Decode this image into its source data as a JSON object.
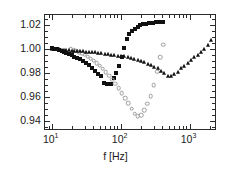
{
  "chart_data": {
    "type": "scatter",
    "title": "",
    "xlabel": "f [Hz]",
    "ylabel": "",
    "xscale": "log",
    "yscale": "linear",
    "xlim": [
      8,
      2500
    ],
    "ylim": [
      0.932,
      1.028
    ],
    "grid": false,
    "legend": "none",
    "xticks": [
      {
        "value": 10,
        "label": "10",
        "exp": "1"
      },
      {
        "value": 100,
        "label": "10",
        "exp": "2"
      },
      {
        "value": 1000,
        "label": "10",
        "exp": "3"
      }
    ],
    "yticks": [
      {
        "value": 1.02,
        "label": "1.02"
      },
      {
        "value": 1.0,
        "label": "1.00"
      },
      {
        "value": 0.98,
        "label": "0.98"
      },
      {
        "value": 0.96,
        "label": "0.96"
      },
      {
        "value": 0.94,
        "label": "0.94"
      }
    ],
    "series": [
      {
        "name": "filled-squares",
        "marker": "square",
        "filled": true,
        "color": "#111111",
        "points": [
          [
            10.0,
            1.0005
          ],
          [
            10.9,
            1.0002
          ],
          [
            11.8,
            0.9998
          ],
          [
            12.8,
            0.9992
          ],
          [
            13.9,
            0.9985
          ],
          [
            15.1,
            0.9977
          ],
          [
            16.4,
            0.9968
          ],
          [
            17.9,
            0.9958
          ],
          [
            19.5,
            0.9947
          ],
          [
            21.3,
            0.9936
          ],
          [
            23.4,
            0.9925
          ],
          [
            25.7,
            0.9912
          ],
          [
            28.3,
            0.9898
          ],
          [
            31.2,
            0.9882
          ],
          [
            34.5,
            0.9864
          ],
          [
            38.2,
            0.9843
          ],
          [
            42.4,
            0.982
          ],
          [
            47.2,
            0.9795
          ],
          [
            52.5,
            0.9774
          ],
          [
            58.0,
            0.9715
          ],
          [
            63.0,
            0.971
          ],
          [
            68.0,
            0.971
          ],
          [
            73.0,
            0.9712
          ],
          [
            79.0,
            0.9755
          ],
          [
            86.0,
            0.98
          ],
          [
            94.0,
            0.986
          ],
          [
            103.0,
            0.993
          ],
          [
            112.0,
            1.0005
          ],
          [
            122.0,
            1.0078
          ],
          [
            133.0,
            1.0122
          ],
          [
            146.0,
            1.0145
          ],
          [
            160.0,
            1.0168
          ],
          [
            176.0,
            1.0182
          ],
          [
            194.0,
            1.0195
          ],
          [
            214.0,
            1.0202
          ],
          [
            236.0,
            1.0208
          ],
          [
            262.0,
            1.0212
          ],
          [
            292.0,
            1.0216
          ],
          [
            326.0,
            1.0218
          ],
          [
            366.0,
            1.022
          ],
          [
            412.0,
            1.0222
          ]
        ]
      },
      {
        "name": "open-circles",
        "marker": "circle",
        "filled": false,
        "color": "#9b9b9b",
        "points": [
          [
            19.0,
            0.9995
          ],
          [
            20.8,
            0.999
          ],
          [
            22.8,
            0.9983
          ],
          [
            25.0,
            0.9974
          ],
          [
            27.5,
            0.9963
          ],
          [
            30.2,
            0.995
          ],
          [
            33.3,
            0.9936
          ],
          [
            36.7,
            0.992
          ],
          [
            40.5,
            0.9902
          ],
          [
            44.8,
            0.9882
          ],
          [
            49.6,
            0.986
          ],
          [
            55.0,
            0.9836
          ],
          [
            61.0,
            0.9808
          ],
          [
            67.8,
            0.9778
          ],
          [
            75.4,
            0.9745
          ],
          [
            84.0,
            0.971
          ],
          [
            93.6,
            0.9672
          ],
          [
            104.0,
            0.9632
          ],
          [
            116.0,
            0.959
          ],
          [
            129.0,
            0.9548
          ],
          [
            144.0,
            0.9503
          ],
          [
            160.0,
            0.9462
          ],
          [
            178.0,
            0.9443
          ],
          [
            198.0,
            0.945
          ],
          [
            220.0,
            0.949
          ],
          [
            245.0,
            0.9545
          ],
          [
            272.0,
            0.9608
          ],
          [
            303.0,
            0.97
          ],
          [
            337.0,
            0.981
          ],
          [
            375.0,
            0.993
          ],
          [
            417.0,
            1.0035
          ]
        ]
      },
      {
        "name": "filled-triangles",
        "marker": "triangle",
        "filled": true,
        "color": "#111111",
        "points": [
          [
            10.0,
            1.0002
          ],
          [
            10.9,
            1.0
          ],
          [
            11.8,
            0.9998
          ],
          [
            12.8,
            0.9996
          ],
          [
            13.9,
            0.9994
          ],
          [
            15.1,
            0.9992
          ],
          [
            16.4,
            0.999
          ],
          [
            17.9,
            0.9988
          ],
          [
            19.5,
            0.9986
          ],
          [
            21.3,
            0.9984
          ],
          [
            23.4,
            0.9982
          ],
          [
            25.7,
            0.998
          ],
          [
            28.3,
            0.9978
          ],
          [
            31.2,
            0.9976
          ],
          [
            34.5,
            0.9974
          ],
          [
            38.2,
            0.9972
          ],
          [
            42.4,
            0.997
          ],
          [
            47.2,
            0.9968
          ],
          [
            52.5,
            0.9963
          ],
          [
            58.5,
            0.9958
          ],
          [
            65.2,
            0.9954
          ],
          [
            72.8,
            0.995
          ],
          [
            81.3,
            0.9947
          ],
          [
            90.8,
            0.9944
          ],
          [
            101.0,
            0.9942
          ],
          [
            113.0,
            0.994
          ],
          [
            126.0,
            0.9935
          ],
          [
            141.0,
            0.9928
          ],
          [
            158.0,
            0.992
          ],
          [
            176.0,
            0.991
          ],
          [
            197.0,
            0.99
          ],
          [
            220.0,
            0.989
          ],
          [
            246.0,
            0.9878
          ],
          [
            275.0,
            0.9866
          ],
          [
            307.0,
            0.9852
          ],
          [
            343.0,
            0.9838
          ],
          [
            384.0,
            0.982
          ],
          [
            429.0,
            0.98
          ],
          [
            480.0,
            0.9778
          ],
          [
            537.0,
            0.9772
          ],
          [
            600.0,
            0.979
          ],
          [
            670.0,
            0.9812
          ],
          [
            749.0,
            0.9838
          ],
          [
            837.0,
            0.9862
          ],
          [
            936.0,
            0.9886
          ],
          [
            1046.0,
            0.9908
          ],
          [
            1169.0,
            0.993
          ],
          [
            1307.0,
            0.995
          ],
          [
            1461.0,
            0.9972
          ],
          [
            1633.0,
            0.9998
          ],
          [
            1826.0,
            1.003
          ],
          [
            2041.0,
            1.007
          ]
        ]
      }
    ]
  }
}
